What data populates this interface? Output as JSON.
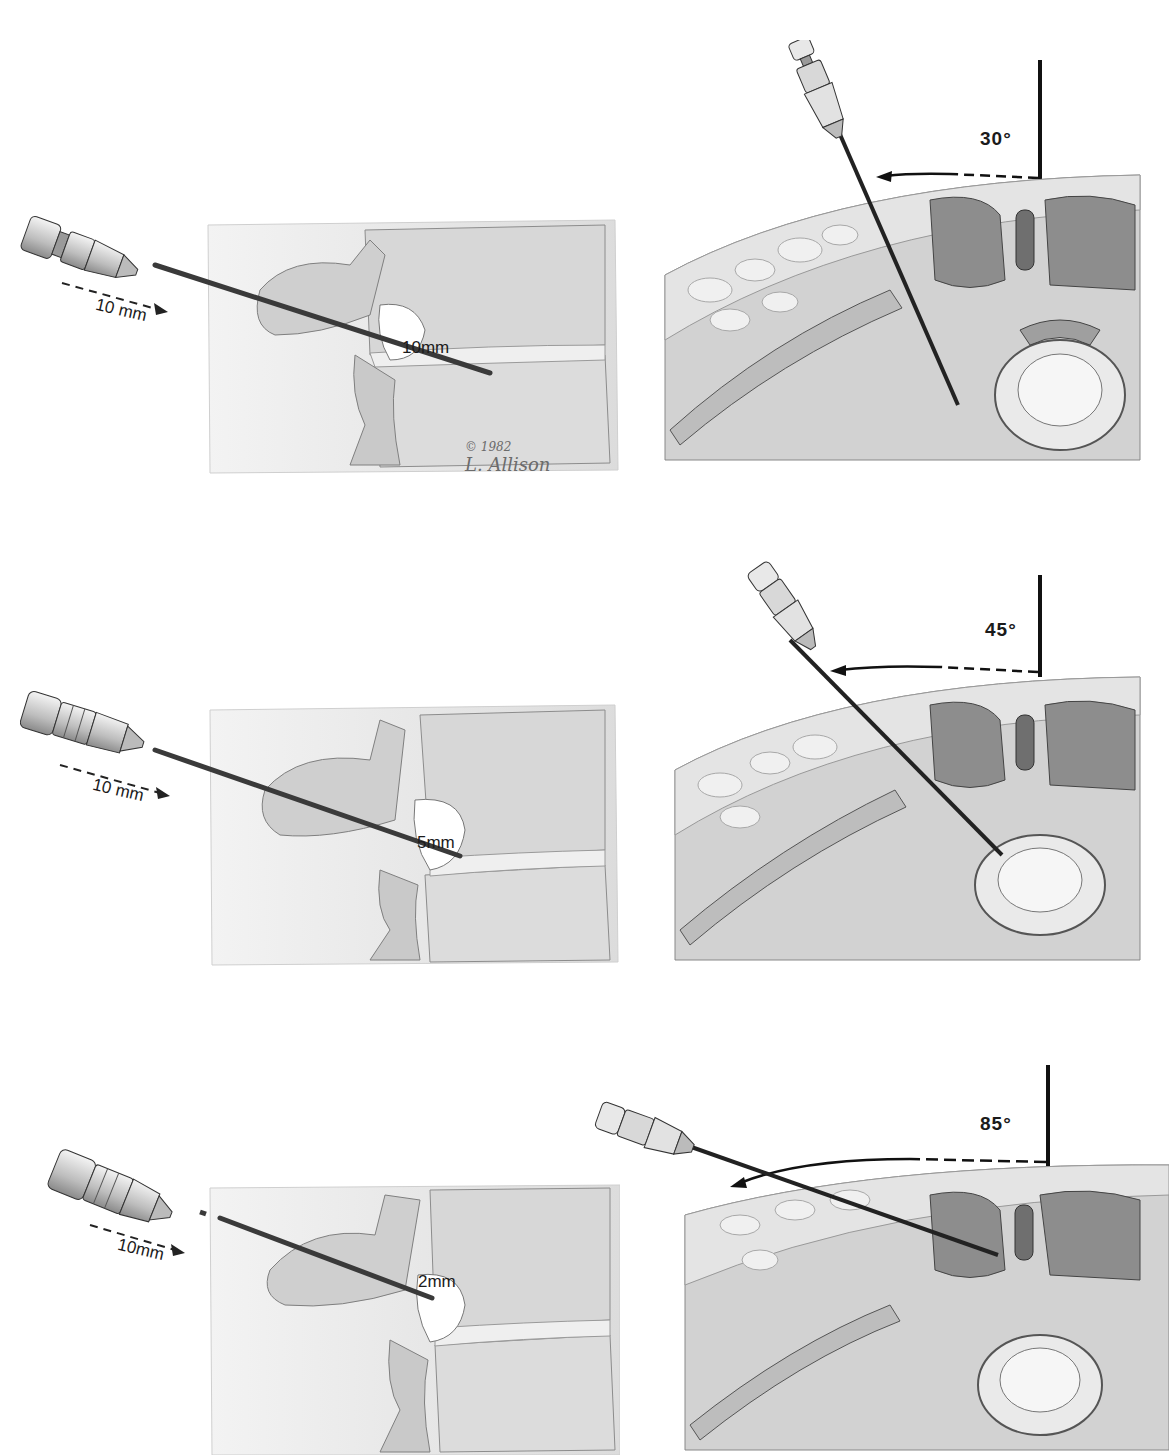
{
  "figure": {
    "rows": [
      {
        "lateral": {
          "advance_label": "10 mm",
          "tip_depth_label": "10mm"
        },
        "axial": {
          "angle_label": "30°",
          "angle_deg": 30
        }
      },
      {
        "lateral": {
          "advance_label": "10 mm",
          "tip_depth_label": "5mm"
        },
        "axial": {
          "angle_label": "45°",
          "angle_deg": 45
        }
      },
      {
        "lateral": {
          "advance_label": "10mm",
          "tip_depth_label": "2mm"
        },
        "axial": {
          "angle_label": "85°",
          "angle_deg": 85
        }
      }
    ],
    "signature": {
      "copyright": "© 1982",
      "artist": "L. Allison"
    },
    "palette": {
      "ink": "#1a1a1a",
      "bone_light": "#e6e6e6",
      "tissue_mid": "#b5b5b5",
      "muscle_dark": "#7a7a7a",
      "paper": "#ffffff"
    }
  }
}
